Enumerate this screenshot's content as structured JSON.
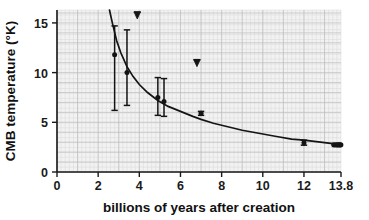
{
  "chart_data": {
    "type": "scatter",
    "title": "",
    "xlabel": "billions of years after creation",
    "ylabel": "CMB temperature (°K)",
    "xlim": [
      0,
      13.8
    ],
    "ylim": [
      0,
      16.3
    ],
    "grid": true,
    "legend": "none",
    "xticks": [
      {
        "value": 0,
        "label": "0"
      },
      {
        "value": 2,
        "label": "2"
      },
      {
        "value": 4,
        "label": "4"
      },
      {
        "value": 6,
        "label": "6"
      },
      {
        "value": 8,
        "label": "8"
      },
      {
        "value": 10,
        "label": "10"
      },
      {
        "value": 12,
        "label": "12"
      },
      {
        "value": 13.8,
        "label": "13.8"
      }
    ],
    "yticks": [
      {
        "value": 0,
        "label": "0"
      },
      {
        "value": 5,
        "label": "5"
      },
      {
        "value": 10,
        "label": "10"
      },
      {
        "value": 15,
        "label": "15"
      }
    ],
    "series": [
      {
        "name": "model curve",
        "type": "line",
        "comment": "T(t) falling adiabatic CMB cooling curve",
        "x": [
          2.55,
          2.7,
          2.9,
          3.1,
          3.4,
          3.7,
          4.0,
          4.4,
          4.9,
          5.4,
          6.0,
          6.6,
          7.0,
          7.6,
          8.2,
          9.0,
          9.8,
          10.6,
          11.4,
          12.0,
          12.8,
          13.4,
          13.8
        ],
        "y": [
          16.3,
          14.9,
          13.2,
          12.0,
          10.6,
          9.6,
          8.8,
          8.0,
          7.2,
          6.6,
          6.1,
          5.6,
          5.3,
          4.9,
          4.6,
          4.2,
          3.9,
          3.6,
          3.3,
          3.2,
          3.0,
          2.85,
          2.75
        ]
      },
      {
        "name": "measurements with error bars",
        "type": "errorbar",
        "points": [
          {
            "x": 2.8,
            "y": 11.8,
            "yerr_low": 5.6,
            "yerr_high": 2.9
          },
          {
            "x": 3.4,
            "y": 10.0,
            "yerr_low": 3.3,
            "yerr_high": 4.3
          },
          {
            "x": 4.9,
            "y": 7.5,
            "yerr_low": 1.8,
            "yerr_high": 2.0
          },
          {
            "x": 5.2,
            "y": 7.1,
            "yerr_low": 1.5,
            "yerr_high": 2.3
          },
          {
            "x": 7.0,
            "y": 5.9,
            "yerr_low": 0.2,
            "yerr_high": 0.2
          },
          {
            "x": 12.0,
            "y": 2.95,
            "yerr_low": 0.25,
            "yerr_high": 0.25
          }
        ]
      },
      {
        "name": "local universe CMB measurements",
        "type": "scatter",
        "points": [
          {
            "x": 13.45,
            "y": 2.73
          },
          {
            "x": 13.55,
            "y": 2.73
          },
          {
            "x": 13.62,
            "y": 2.73
          },
          {
            "x": 13.68,
            "y": 2.73
          },
          {
            "x": 13.74,
            "y": 2.73
          },
          {
            "x": 13.79,
            "y": 2.73
          }
        ]
      },
      {
        "name": "upper limits",
        "type": "upper-limit",
        "points": [
          {
            "x": 3.9,
            "y": 15.8
          },
          {
            "x": 6.8,
            "y": 11.0
          }
        ]
      }
    ]
  }
}
